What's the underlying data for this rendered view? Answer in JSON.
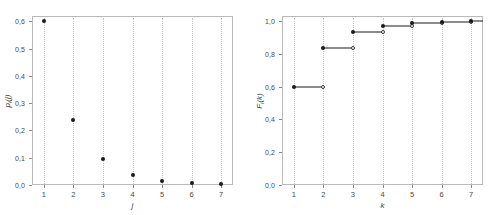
{
  "figure": {
    "panels": [
      {
        "id": "left",
        "xlabel": "j",
        "ylabel_main": "p",
        "ylabel_sub": "i",
        "ylabel_tail": "(j)",
        "yticks": [
          "0,0",
          "0,1",
          "0,2",
          "0,3",
          "0,4",
          "0,5",
          "0,6"
        ],
        "ytick_values": [
          0.0,
          0.1,
          0.2,
          0.3,
          0.4,
          0.5,
          0.6
        ],
        "xticks": [
          "1",
          "2",
          "3",
          "4",
          "5",
          "6",
          "7"
        ]
      },
      {
        "id": "right",
        "xlabel": "k",
        "ylabel_main": "F",
        "ylabel_sub": "i",
        "ylabel_tail": "(k)",
        "yticks": [
          "0,0",
          "0,2",
          "0,4",
          "0,6",
          "0,8",
          "1,0"
        ],
        "ytick_values": [
          0.0,
          0.2,
          0.4,
          0.6,
          0.8,
          1.0
        ],
        "xticks": [
          "1",
          "2",
          "3",
          "4",
          "5",
          "6",
          "7"
        ]
      }
    ]
  },
  "chart_data": [
    {
      "type": "scatter",
      "title": "",
      "xlabel": "j",
      "ylabel": "p_i(j)",
      "x": [
        1,
        2,
        3,
        4,
        5,
        6,
        7
      ],
      "values": [
        0.6,
        0.238,
        0.095,
        0.038,
        0.015,
        0.007,
        0.004
      ],
      "xlim": [
        0.6,
        7.4
      ],
      "ylim": [
        0.0,
        0.62
      ],
      "grid": false,
      "legend": "none",
      "marker": "filled-circle",
      "dropline_style": "dotted"
    },
    {
      "type": "line",
      "title": "",
      "xlabel": "k",
      "ylabel": "F_i(k)",
      "x": [
        1,
        2,
        3,
        4,
        5,
        6,
        7
      ],
      "values": [
        0.6,
        0.838,
        0.933,
        0.971,
        0.986,
        0.993,
        0.997
      ],
      "xlim": [
        0.6,
        7.4
      ],
      "ylim": [
        0.0,
        1.03
      ],
      "grid": false,
      "legend": "none",
      "marker": "step-filled-open",
      "dropline_style": "dotted"
    }
  ],
  "colors": {
    "marker": "#1a1a1a",
    "frame": "#b9b9b9",
    "guide": "#c3c3c3",
    "text": "#4a4a4a",
    "background": "#ffffff"
  }
}
